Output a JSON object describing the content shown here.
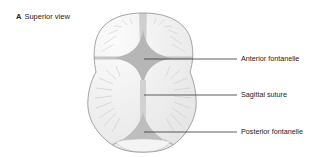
{
  "figure": {
    "panel_letter": "A",
    "panel_title": "Superior view",
    "labels": [
      {
        "id": "anterior-fontanelle",
        "text": "Anterior fontanelle"
      },
      {
        "id": "sagittal-suture",
        "text": "Sagittal suture"
      },
      {
        "id": "posterior-fontanelle",
        "text": "Posterior fontanelle"
      }
    ],
    "colors": {
      "outline": "#8a8a8a",
      "bone_fill": "#f2f2f2",
      "bone_rays": "#c8c8c8",
      "suture_fill": "#bdbdbd",
      "fontanelle_fill": "#b0b0b0",
      "leader_line": "#333333",
      "text": "#222222"
    }
  }
}
